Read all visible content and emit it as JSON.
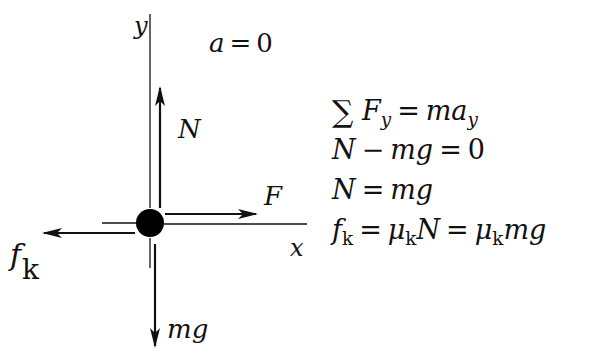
{
  "diagram": {
    "accel_label": "a = 0",
    "axes": {
      "x_label": "x",
      "y_label": "y"
    },
    "forces": [
      {
        "id": "normal",
        "label": "N",
        "direction": "up"
      },
      {
        "id": "applied",
        "label": "F",
        "direction": "right"
      },
      {
        "id": "friction",
        "label": "f",
        "subscript": "k",
        "direction": "left"
      },
      {
        "id": "weight",
        "label": "mg",
        "direction": "down"
      }
    ],
    "equations": [
      {
        "text": "∑ F_y = m a_y"
      },
      {
        "text": "N − mg = 0"
      },
      {
        "text": "N = mg"
      },
      {
        "text": "f_k = μ_k N = μ_k mg"
      }
    ],
    "colors": {
      "ink": "#111111",
      "background": "#ffffff"
    }
  },
  "labels": {
    "a": "a",
    "eq_sign": "=",
    "zero": "0",
    "y": "y",
    "x": "x",
    "N": "N",
    "F": "F",
    "f": "f",
    "k": "k",
    "mg": "mg"
  },
  "eq": {
    "l1": {
      "sigma": "∑",
      "F": "F",
      "y": "y",
      "eq": "=",
      "ma": "ma",
      "ysub": "y"
    },
    "l2": {
      "N": "N",
      "minus": "−",
      "mg": "mg",
      "eq": "=",
      "zero": "0"
    },
    "l3": {
      "N": "N",
      "eq": "=",
      "mg": "mg"
    },
    "l4": {
      "f": "f",
      "k": "k",
      "eq1": "=",
      "mu1": "μ",
      "k1": "k",
      "N": "N",
      "eq2": "=",
      "mu2": "μ",
      "k2": "k",
      "mg": "mg"
    }
  }
}
